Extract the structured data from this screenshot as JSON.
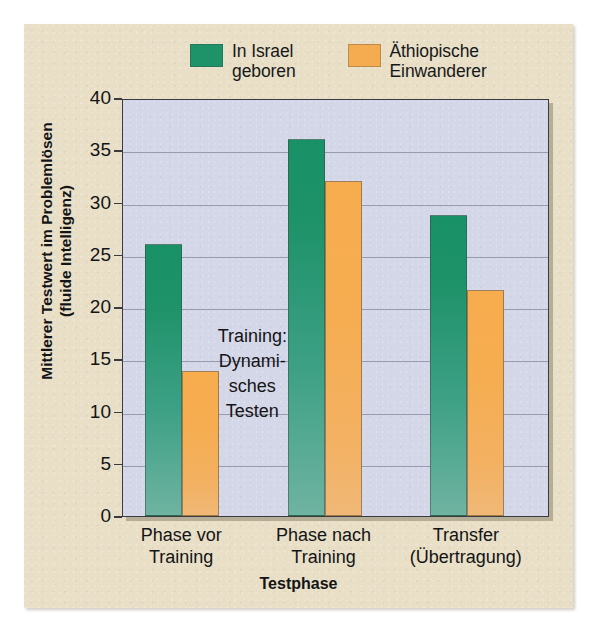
{
  "chart_data": {
    "type": "bar",
    "title": "",
    "xlabel": "Testphase",
    "ylabel": "Mittlerer Testwert im Problemlösen\n(fluide Intelligenz)",
    "categories": [
      "Phase vor\nTraining",
      "Phase nach\nTraining",
      "Transfer\n(Übertragung)"
    ],
    "series": [
      {
        "name": "In Israel\ngeboren",
        "color": "#1e9269",
        "values": [
          26.0,
          36.1,
          28.8
        ]
      },
      {
        "name": "Äthiopische\nEinwanderer",
        "color": "#f5ac50",
        "values": [
          13.9,
          32.1,
          21.6
        ]
      }
    ],
    "ylim": [
      0,
      40
    ],
    "yticks": [
      0,
      5,
      10,
      15,
      20,
      25,
      30,
      35,
      40
    ],
    "ytick_labels": [
      "0",
      "5",
      "10",
      "15",
      "20",
      "25",
      "30",
      "35",
      "40"
    ],
    "grid": "horizontal",
    "legend_position": "top",
    "annotations": [
      {
        "text": "Training:\nDynami-\nsches\nTesten",
        "between_categories": [
          0,
          1
        ]
      }
    ],
    "plot_background": "#d4d7e8",
    "figure_background": "#e8dfc6"
  },
  "legend": {
    "items": [
      {
        "label": "In Israel\ngeboren",
        "color": "#1e9269"
      },
      {
        "label": "Äthiopische\nEinwanderer",
        "color": "#f5ac50"
      }
    ]
  },
  "axes": {
    "y_title": "Mittlerer Testwert im Problemlösen\n(fluide Intelligenz)",
    "x_title": "Testphase",
    "y_ticks": [
      "40",
      "35",
      "30",
      "25",
      "20",
      "15",
      "10",
      "5",
      "0"
    ],
    "x_ticks": [
      "Phase vor\nTraining",
      "Phase nach\nTraining",
      "Transfer\n(Übertragung)"
    ]
  },
  "annotation": {
    "training_note": "Training:\nDynami-\nsches\nTesten"
  }
}
